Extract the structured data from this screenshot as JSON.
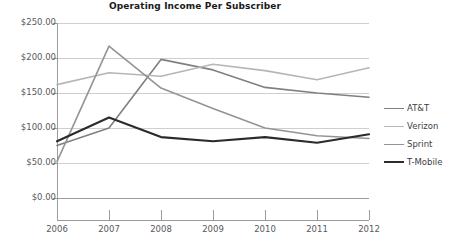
{
  "chart_data": {
    "type": "line",
    "title": "Operating Income Per Subscriber",
    "xlabel": "",
    "ylabel": "",
    "categories": [
      "2006",
      "2007",
      "2008",
      "2009",
      "2010",
      "2011",
      "2012"
    ],
    "x": [
      2006,
      2007,
      2008,
      2009,
      2010,
      2011,
      2012
    ],
    "ylim": [
      0,
      250
    ],
    "yticks": [
      0,
      50,
      100,
      150,
      200,
      250
    ],
    "ytick_labels": [
      "$0.00",
      "$50.00",
      "$100.00",
      "$150.00",
      "$200.00",
      "$250.00"
    ],
    "grid": true,
    "legend_position": "right",
    "series": [
      {
        "name": "AT&T",
        "color": "#808083",
        "width": 1.6,
        "values": [
          75,
          100,
          198,
          183,
          158,
          150,
          144
        ]
      },
      {
        "name": "Verizon",
        "color": "#b6b6b8",
        "width": 1.6,
        "values": [
          162,
          179,
          174,
          191,
          182,
          169,
          186
        ]
      },
      {
        "name": "Sprint",
        "color": "#949497",
        "width": 1.6,
        "values": [
          52,
          217,
          157,
          128,
          100,
          89,
          85
        ]
      },
      {
        "name": "T-Mobile",
        "color": "#2b2b2d",
        "width": 2.1,
        "values": [
          81,
          115,
          87,
          81,
          87,
          79,
          91
        ]
      }
    ]
  },
  "axis": {
    "line_color": "#9b9b9e",
    "grid_color": "#cfcfd2",
    "tick_color": "#9b9b9e",
    "label_color": "#59595b"
  },
  "legend": {
    "items": [
      {
        "label": "AT&T"
      },
      {
        "label": "Verizon"
      },
      {
        "label": "Sprint"
      },
      {
        "label": "T-Mobile"
      }
    ]
  }
}
